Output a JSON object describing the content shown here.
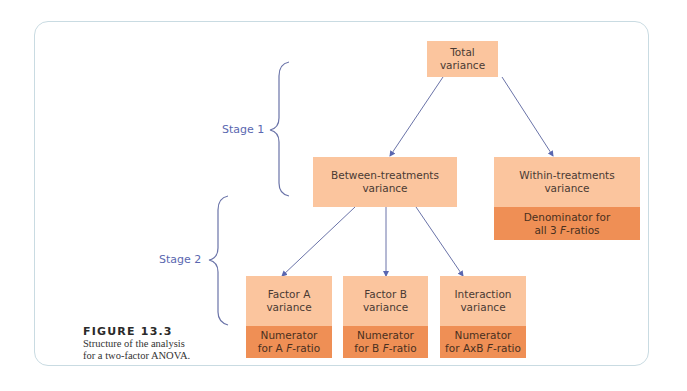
{
  "figure": {
    "label": "FIGURE 13.3",
    "caption_line1": "Structure of the analysis",
    "caption_line2": "for a two-factor ANOVA."
  },
  "stages": [
    {
      "label": "Stage 1"
    },
    {
      "label": "Stage 2"
    }
  ],
  "nodes": {
    "total": {
      "title": "Total\nvariance"
    },
    "between": {
      "title": "Between-treatments\nvariance"
    },
    "within": {
      "title": "Within-treatments\nvariance",
      "role_prefix": "Denominator for\nall 3 ",
      "role_italic": "F",
      "role_suffix": "-ratios"
    },
    "factor_a": {
      "title": "Factor A\nvariance",
      "role_prefix": "Numerator\nfor A ",
      "role_italic": "F",
      "role_suffix": "-ratio"
    },
    "factor_b": {
      "title": "Factor B\nvariance",
      "role_prefix": "Numerator\nfor B ",
      "role_italic": "F",
      "role_suffix": "-ratio"
    },
    "interaction": {
      "title": "Interaction\nvariance",
      "role_prefix": "Numerator\nfor AxB ",
      "role_italic": "F",
      "role_suffix": "-ratio"
    }
  },
  "edges": [
    {
      "from": "total",
      "to": "between"
    },
    {
      "from": "total",
      "to": "within"
    },
    {
      "from": "between",
      "to": "factor_a"
    },
    {
      "from": "between",
      "to": "factor_b"
    },
    {
      "from": "between",
      "to": "interaction"
    }
  ],
  "colors": {
    "node_light": "#fbc59e",
    "node_dark": "#ef8f55",
    "arrow": "#5a67b0",
    "brace": "#6a73a8",
    "frame": "#c9dbe2"
  }
}
